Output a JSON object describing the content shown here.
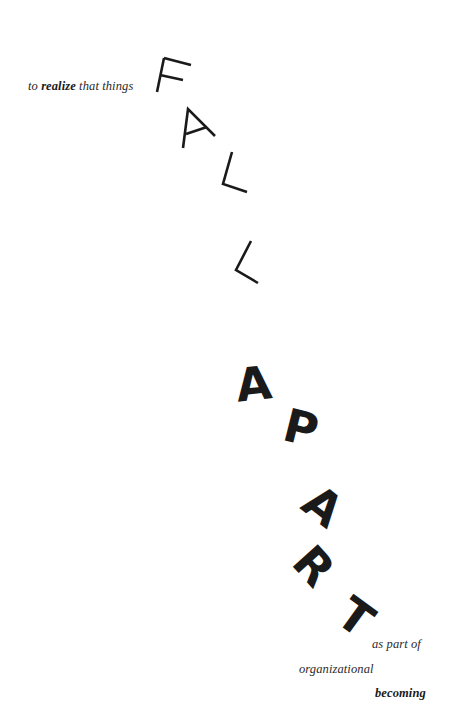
{
  "poster": {
    "intro": {
      "before": "to ",
      "emphasis": "realize",
      "after": " that things"
    },
    "word_fall": [
      "F",
      "A",
      "L",
      "L"
    ],
    "word_apart": [
      "A",
      "P",
      "A",
      "R",
      "T"
    ],
    "outro": {
      "line1": "as part of",
      "line2": "organizational",
      "line3": "becoming"
    },
    "colors": {
      "background": "#ffffff",
      "ink": "#1a1a1a",
      "serif_text": "#2a2a2a"
    }
  }
}
